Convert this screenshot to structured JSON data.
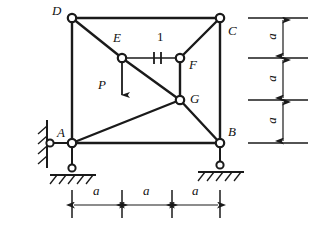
{
  "figure": {
    "type": "truss-structural-diagram",
    "background_color": "#ffffff",
    "line_color": "#1a1a1a",
    "joint_fill": "#ffffff"
  },
  "joints": [
    {
      "id": "A",
      "label": "A",
      "x": 72,
      "y": 143,
      "label_x": 57,
      "label_y": 126
    },
    {
      "id": "B",
      "label": "B",
      "x": 220,
      "y": 143,
      "label_x": 228,
      "label_y": 125
    },
    {
      "id": "C",
      "label": "C",
      "x": 220,
      "y": 18,
      "label_x": 228,
      "label_y": 24
    },
    {
      "id": "D",
      "label": "D",
      "x": 72,
      "y": 18,
      "label_x": 52,
      "label_y": 4
    },
    {
      "id": "E",
      "label": "E",
      "x": 122,
      "y": 58,
      "label_x": 113,
      "label_y": 31
    },
    {
      "id": "F",
      "label": "F",
      "x": 180,
      "y": 58,
      "label_x": 189,
      "label_y": 58
    },
    {
      "id": "G",
      "label": "G",
      "x": 180,
      "y": 100,
      "label_x": 190,
      "label_y": 92
    }
  ],
  "members": [
    {
      "name": "top-chord-DC",
      "from": "D",
      "to": "C"
    },
    {
      "name": "left-post-DA",
      "from": "D",
      "to": "A"
    },
    {
      "name": "right-post-CB",
      "from": "C",
      "to": "B"
    },
    {
      "name": "bottom-chord-AB",
      "from": "A",
      "to": "B"
    },
    {
      "name": "diagonal-DE",
      "from": "D",
      "to": "E"
    },
    {
      "name": "diagonal-EG",
      "from": "E",
      "to": "G"
    },
    {
      "name": "member-EF",
      "from": "E",
      "to": "F"
    },
    {
      "name": "diagonal-FC",
      "from": "F",
      "to": "C"
    },
    {
      "name": "post-FG",
      "from": "F",
      "to": "G"
    },
    {
      "name": "diagonal-AG",
      "from": "A",
      "to": "G"
    },
    {
      "name": "diagonal-GB",
      "from": "G",
      "to": "B"
    }
  ],
  "member_marker": {
    "label": "1",
    "label_x": 157,
    "label_y": 30,
    "tick_x1": 154,
    "tick_x2": 161,
    "tick_y_top": 52,
    "tick_y_bottom": 64
  },
  "load": {
    "label": "P",
    "label_x": 98,
    "label_y": 78,
    "arrow_x": 122,
    "arrow_y_start": 58,
    "arrow_y_end": 99
  },
  "supports": [
    {
      "name": "pin-support-left-wall",
      "type": "pin-horizontal-link",
      "x": 50,
      "y": 143,
      "wall_x": 47,
      "wall_y_top": 120,
      "wall_y_bottom": 166
    },
    {
      "name": "roller-support-under-A",
      "type": "pin-on-ground",
      "x": 72,
      "y": 168,
      "ground_y": 175,
      "ground_x1": 50,
      "ground_x2": 96
    },
    {
      "name": "roller-support-under-B",
      "type": "pin-on-ground",
      "x": 220,
      "y": 165,
      "ground_y": 172,
      "ground_x1": 198,
      "ground_x2": 244
    }
  ],
  "dimensions": {
    "horizontal": {
      "axis_y": 205,
      "tick_y_top": 190,
      "tick_y_bottom": 218,
      "stations": [
        72,
        122,
        172,
        220
      ],
      "segments": [
        {
          "label": "a",
          "label_x": 93,
          "label_y": 184
        },
        {
          "label": "a",
          "label_x": 143,
          "label_y": 184
        },
        {
          "label": "a",
          "label_x": 192,
          "label_y": 184
        }
      ]
    },
    "vertical": {
      "axis_x": 283,
      "ext_x1": 248,
      "ext_x2": 308,
      "stations": [
        18,
        58,
        100,
        143
      ],
      "segments": [
        {
          "label": "a",
          "label_x": 272,
          "label_y": 32
        },
        {
          "label": "a",
          "label_x": 272,
          "label_y": 73
        },
        {
          "label": "a",
          "label_x": 272,
          "label_y": 115
        }
      ]
    }
  }
}
